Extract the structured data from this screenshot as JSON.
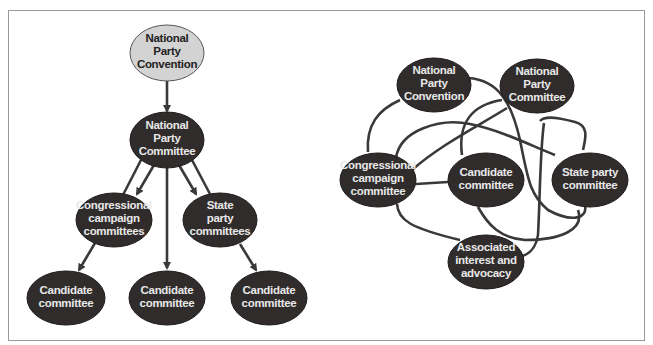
{
  "colors": {
    "dark_node": "#302c2c",
    "light_node": "#d3d3d3",
    "edge": "#3b3838",
    "frame_border": "#9a9a9a",
    "background": "#ffffff"
  },
  "left_diagram": {
    "type": "hierarchical",
    "nodes": {
      "npc": {
        "lines": [
          "National",
          "Party",
          "Convention"
        ]
      },
      "npcomm": {
        "lines": [
          "National",
          "Party",
          "Committee"
        ]
      },
      "congr": {
        "lines": [
          "Congressional",
          "campaign",
          "committees"
        ]
      },
      "state": {
        "lines": [
          "State",
          "party",
          "committees"
        ]
      },
      "cand1": {
        "lines": [
          "Candidate",
          "committee"
        ]
      },
      "cand2": {
        "lines": [
          "Candidate",
          "committee"
        ]
      },
      "cand3": {
        "lines": [
          "Candidate",
          "committee"
        ]
      }
    }
  },
  "right_diagram": {
    "type": "network",
    "nodes": {
      "npc": {
        "lines": [
          "National",
          "Party",
          "Convention"
        ]
      },
      "npcomm": {
        "lines": [
          "National",
          "Party",
          "Committee"
        ]
      },
      "congr": {
        "lines": [
          "Congressional",
          "campaign",
          "committee"
        ]
      },
      "cand": {
        "lines": [
          "Candidate",
          "committee"
        ]
      },
      "state": {
        "lines": [
          "State party",
          "committee"
        ]
      },
      "assoc": {
        "lines": [
          "Associated",
          "interest and",
          "advocacy"
        ]
      }
    }
  }
}
